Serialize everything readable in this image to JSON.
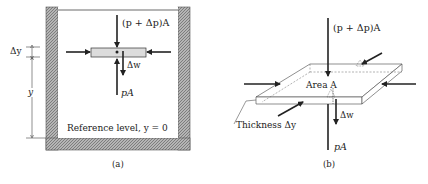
{
  "panel_a": {
    "caption": "(a)",
    "top_force": "(p + Δp)A",
    "bottom_force": "pA",
    "weight": "Δw",
    "delta_y": "Δy",
    "y": "y",
    "reference": "Reference level, y = 0"
  },
  "panel_b": {
    "caption": "(b)",
    "top_force": "(p + Δp)A",
    "bottom_force": "pA",
    "weight": "Δw",
    "area": "Area A",
    "thickness": "Thickness Δy"
  },
  "colors": {
    "ink": "#222222",
    "hatch": "#9a9a9a",
    "element_fill": "#dcdcdc"
  }
}
